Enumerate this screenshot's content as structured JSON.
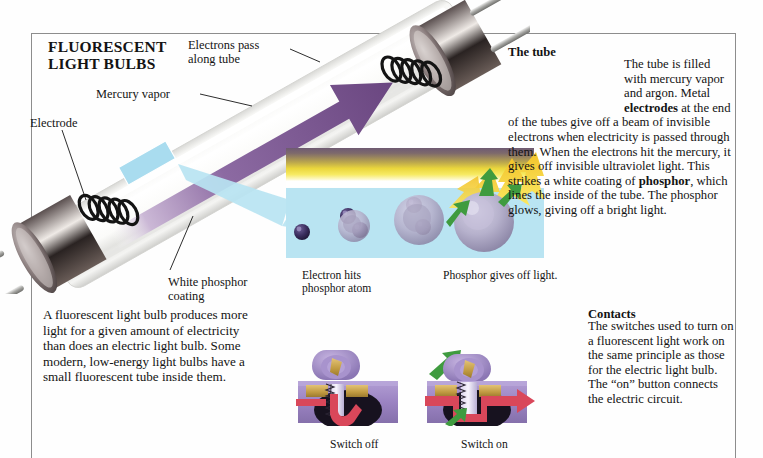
{
  "labels": {
    "electrons_pass": "Electrons pass\nalong tube",
    "mercury_vapor": "Mercury vapor",
    "electrode": "Electrode",
    "white_phosphor_coating": "White phosphor\ncoating",
    "electron_hits": "Electron hits\nphosphor atom",
    "phosphor_gives_off": "Phosphor gives off light.",
    "switch_off": "Switch off",
    "switch_on": "Switch on"
  },
  "body_left": "A fluorescent light bulb produces more light for a given amount of electricity than does an electric light bulb. Some modern, low-energy light bulbs have a small fluorescent tube inside them.",
  "tube": {
    "heading": "The tube",
    "p1": "The tube is filled with mercury vapor and argon. Metal ",
    "b1": "electrodes",
    "p2": " at the end of the tubes give off a beam of invisible electrons when electricity is passed through them. When the electrons hit the mercury, it gives off invisible ultraviolet light. This strikes a white coating of ",
    "b2": "phosphor",
    "p3": ", which lines the inside of the tube. The phosphor glows, giving off a bright light."
  },
  "contacts": {
    "heading": "Contacts",
    "text": "The switches used to turn on a fluorescent light work on the same principle as those for the electric light bulb. The “on” button connects the electric circuit."
  },
  "colors": {
    "purple_arrow": "#6e4b86",
    "plasma_blue": "#b9e4f2",
    "uv_yellow": "#f3e04a",
    "green_arrow": "#3a9a3c",
    "switch_purple": "#9a84c0",
    "red_circuit": "#d9475a",
    "gold_contact": "#c9a24a",
    "frame": "#8d8d8d",
    "glass_white": "#f2f2f0"
  },
  "icons": {
    "electron": "electron-dot",
    "phosphor_atom": "phosphor-atom",
    "arrow_green": "green-arrow-icon",
    "arrow_yellow": "yellow-light-arrow-icon",
    "arrow_purple": "purple-electron-beam-arrow"
  }
}
